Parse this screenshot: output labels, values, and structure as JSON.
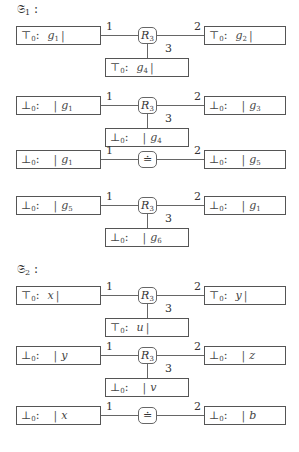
{
  "graphs": [
    {
      "title": "𝔖",
      "title_sub": "1",
      "title_suffix": " :",
      "rows": [
        {
          "node": {
            "kind": "relation",
            "label": "R",
            "sub": "3"
          },
          "left": {
            "symbol": "⊤",
            "sub": "0",
            "bar_after_value": true,
            "value": "g",
            "value_sub": "1"
          },
          "right": {
            "symbol": "⊤",
            "sub": "0",
            "bar_after_value": true,
            "value": "g",
            "value_sub": "2"
          },
          "bottom": {
            "symbol": "⊤",
            "sub": "0",
            "bar_after_value": true,
            "value": "g",
            "value_sub": "4"
          },
          "port_labels": [
            "1",
            "2",
            "3"
          ]
        },
        {
          "node": {
            "kind": "relation",
            "label": "R",
            "sub": "3"
          },
          "left": {
            "symbol": "⊥",
            "sub": "0",
            "bar_after_value": false,
            "value": "g",
            "value_sub": "1"
          },
          "right": {
            "symbol": "⊥",
            "sub": "0",
            "bar_after_value": false,
            "value": "g",
            "value_sub": "3"
          },
          "bottom": {
            "symbol": "⊥",
            "sub": "0",
            "bar_after_value": false,
            "value": "g",
            "value_sub": "4"
          },
          "port_labels": [
            "1",
            "2",
            "3"
          ]
        },
        {
          "node": {
            "kind": "equality",
            "label": "≐",
            "sub": ""
          },
          "left": {
            "symbol": "⊥",
            "sub": "0",
            "bar_after_value": false,
            "value": "g",
            "value_sub": "1"
          },
          "right": {
            "symbol": "⊥",
            "sub": "0",
            "bar_after_value": false,
            "value": "g",
            "value_sub": "5"
          },
          "port_labels": [
            "1",
            "2"
          ]
        },
        {
          "node": {
            "kind": "relation",
            "label": "R",
            "sub": "3"
          },
          "left": {
            "symbol": "⊥",
            "sub": "0",
            "bar_after_value": false,
            "value": "g",
            "value_sub": "5"
          },
          "right": {
            "symbol": "⊥",
            "sub": "0",
            "bar_after_value": false,
            "value": "g",
            "value_sub": "1"
          },
          "bottom": {
            "symbol": "⊥",
            "sub": "0",
            "bar_after_value": false,
            "value": "g",
            "value_sub": "6"
          },
          "port_labels": [
            "1",
            "2",
            "3"
          ]
        }
      ]
    },
    {
      "title": "𝔖",
      "title_sub": "2",
      "title_suffix": " :",
      "rows": [
        {
          "node": {
            "kind": "relation",
            "label": "R",
            "sub": "3"
          },
          "left": {
            "symbol": "⊤",
            "sub": "0",
            "bar_after_value": true,
            "value": "x",
            "value_sub": ""
          },
          "right": {
            "symbol": "⊤",
            "sub": "0",
            "bar_after_value": true,
            "value": "y",
            "value_sub": ""
          },
          "bottom": {
            "symbol": "⊤",
            "sub": "0",
            "bar_after_value": true,
            "value": "u",
            "value_sub": ""
          },
          "port_labels": [
            "1",
            "2",
            "3"
          ]
        },
        {
          "node": {
            "kind": "relation",
            "label": "R",
            "sub": "3"
          },
          "left": {
            "symbol": "⊥",
            "sub": "0",
            "bar_after_value": false,
            "value": "y",
            "value_sub": ""
          },
          "right": {
            "symbol": "⊥",
            "sub": "0",
            "bar_after_value": false,
            "value": "z",
            "value_sub": ""
          },
          "bottom": {
            "symbol": "⊥",
            "sub": "0",
            "bar_after_value": false,
            "value": "v",
            "value_sub": ""
          },
          "port_labels": [
            "1",
            "2",
            "3"
          ]
        },
        {
          "node": {
            "kind": "equality",
            "label": "≐",
            "sub": ""
          },
          "left": {
            "symbol": "⊥",
            "sub": "0",
            "bar_after_value": false,
            "value": "x",
            "value_sub": ""
          },
          "right": {
            "symbol": "⊥",
            "sub": "0",
            "bar_after_value": false,
            "value": "b",
            "value_sub": ""
          },
          "port_labels": [
            "1",
            "2"
          ]
        }
      ]
    }
  ]
}
